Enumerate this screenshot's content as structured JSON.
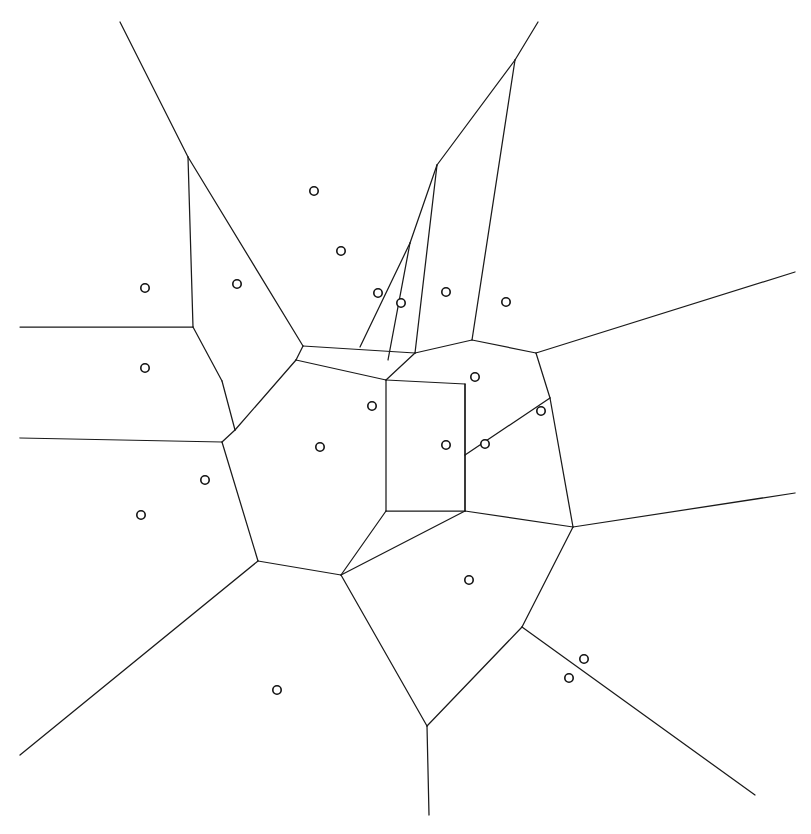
{
  "figure": {
    "width": 811,
    "height": 834,
    "background_color": "#ffffff",
    "edge_color": "#1a1a1a",
    "site_stroke_color": "#111111",
    "site_fill_color": "#ffffff",
    "edge_stroke_width": 1.25,
    "site_radius": 4.2,
    "site_count": 21,
    "edge_count": 44
  },
  "chart_data": {
    "type": "scatter",
    "subtitle": "",
    "xlabel": "",
    "ylabel": "",
    "xlim": [
      0,
      811
    ],
    "ylim": [
      0,
      834
    ],
    "grid": false,
    "legend": "none",
    "annotations": [],
    "marker_style": "open-circle",
    "sites": [
      {
        "id": "s1",
        "x": 314,
        "y": 191
      },
      {
        "id": "s2",
        "x": 341,
        "y": 251
      },
      {
        "id": "s3",
        "x": 145,
        "y": 288
      },
      {
        "id": "s4",
        "x": 237,
        "y": 284
      },
      {
        "id": "s5",
        "x": 378,
        "y": 293
      },
      {
        "id": "s6",
        "x": 401,
        "y": 303
      },
      {
        "id": "s7",
        "x": 446,
        "y": 292
      },
      {
        "id": "s8",
        "x": 506,
        "y": 302
      },
      {
        "id": "s9",
        "x": 145,
        "y": 368
      },
      {
        "id": "s10",
        "x": 475,
        "y": 377
      },
      {
        "id": "s11",
        "x": 372,
        "y": 406
      },
      {
        "id": "s12",
        "x": 541,
        "y": 411
      },
      {
        "id": "s13",
        "x": 320,
        "y": 447
      },
      {
        "id": "s14",
        "x": 446,
        "y": 445
      },
      {
        "id": "s15",
        "x": 485,
        "y": 444
      },
      {
        "id": "s16",
        "x": 141,
        "y": 515
      },
      {
        "id": "s17",
        "x": 469,
        "y": 580
      },
      {
        "id": "s18",
        "x": 584,
        "y": 659
      },
      {
        "id": "s19",
        "x": 569,
        "y": 678
      },
      {
        "id": "s20",
        "x": 277,
        "y": 690
      },
      {
        "id": "s21",
        "x": 205,
        "y": 480
      }
    ],
    "edges": [
      {
        "id": "e1",
        "points": [
          [
            120,
            22
          ],
          [
            188,
            157
          ]
        ],
        "kind": "ray"
      },
      {
        "id": "e2",
        "points": [
          [
            188,
            157
          ],
          [
            193,
            327
          ]
        ],
        "kind": "segment"
      },
      {
        "id": "e3",
        "points": [
          [
            188,
            157
          ],
          [
            303,
            346
          ]
        ],
        "kind": "segment"
      },
      {
        "id": "e4",
        "points": [
          [
            20,
            327
          ],
          [
            193,
            327
          ]
        ],
        "kind": "ray"
      },
      {
        "id": "e5",
        "points": [
          [
            193,
            327
          ],
          [
            222,
            381
          ]
        ],
        "kind": "segment"
      },
      {
        "id": "e6",
        "points": [
          [
            222,
            381
          ],
          [
            235,
            430
          ]
        ],
        "kind": "segment"
      },
      {
        "id": "e7",
        "points": [
          [
            20,
            438
          ],
          [
            222,
            442
          ]
        ],
        "kind": "ray"
      },
      {
        "id": "e8",
        "points": [
          [
            235,
            430
          ],
          [
            222,
            442
          ]
        ],
        "kind": "segment"
      },
      {
        "id": "e9",
        "points": [
          [
            222,
            442
          ],
          [
            258,
            561
          ]
        ],
        "kind": "segment"
      },
      {
        "id": "e10",
        "points": [
          [
            258,
            561
          ],
          [
            20,
            755
          ]
        ],
        "kind": "ray"
      },
      {
        "id": "e11",
        "points": [
          [
            258,
            561
          ],
          [
            341,
            575
          ]
        ],
        "kind": "segment"
      },
      {
        "id": "e12",
        "points": [
          [
            341,
            575
          ],
          [
            427,
            726
          ]
        ],
        "kind": "segment"
      },
      {
        "id": "e13",
        "points": [
          [
            427,
            726
          ],
          [
            429,
            815
          ]
        ],
        "kind": "ray"
      },
      {
        "id": "e14",
        "points": [
          [
            427,
            726
          ],
          [
            522,
            627
          ]
        ],
        "kind": "segment"
      },
      {
        "id": "e15",
        "points": [
          [
            522,
            627
          ],
          [
            573,
            527
          ]
        ],
        "kind": "segment"
      },
      {
        "id": "e16",
        "points": [
          [
            522,
            627
          ],
          [
            755,
            795
          ]
        ],
        "kind": "ray"
      },
      {
        "id": "e17",
        "points": [
          [
            573,
            527
          ],
          [
            795,
            493
          ]
        ],
        "kind": "ray"
      },
      {
        "id": "e18",
        "points": [
          [
            573,
            527
          ],
          [
            465,
            511
          ]
        ],
        "kind": "segment"
      },
      {
        "id": "e19",
        "points": [
          [
            465,
            511
          ],
          [
            341,
            575
          ]
        ],
        "kind": "segment"
      },
      {
        "id": "e20",
        "points": [
          [
            465,
            511
          ],
          [
            465,
            384
          ]
        ],
        "kind": "segment"
      },
      {
        "id": "e21",
        "points": [
          [
            465,
            384
          ],
          [
            386,
            380
          ]
        ],
        "kind": "segment"
      },
      {
        "id": "e22",
        "points": [
          [
            386,
            380
          ],
          [
            386,
            511
          ]
        ],
        "kind": "segment"
      },
      {
        "id": "e23",
        "points": [
          [
            386,
            511
          ],
          [
            465,
            511
          ]
        ],
        "kind": "segment"
      },
      {
        "id": "e24",
        "points": [
          [
            386,
            511
          ],
          [
            341,
            575
          ]
        ],
        "kind": "segment"
      },
      {
        "id": "e25",
        "points": [
          [
            386,
            380
          ],
          [
            415,
            353
          ]
        ],
        "kind": "segment"
      },
      {
        "id": "e26",
        "points": [
          [
            415,
            353
          ],
          [
            303,
            346
          ]
        ],
        "kind": "segment"
      },
      {
        "id": "e27",
        "points": [
          [
            303,
            346
          ],
          [
            296,
            360
          ]
        ],
        "kind": "segment"
      },
      {
        "id": "e28",
        "points": [
          [
            296,
            360
          ],
          [
            235,
            430
          ]
        ],
        "kind": "segment"
      },
      {
        "id": "e29",
        "points": [
          [
            296,
            360
          ],
          [
            386,
            380
          ]
        ],
        "kind": "segment"
      },
      {
        "id": "e30",
        "points": [
          [
            415,
            353
          ],
          [
            437,
            165
          ]
        ],
        "kind": "segment"
      },
      {
        "id": "e31",
        "points": [
          [
            437,
            165
          ],
          [
            515,
            60
          ]
        ],
        "kind": "segment"
      },
      {
        "id": "e32",
        "points": [
          [
            515,
            60
          ],
          [
            538,
            22
          ]
        ],
        "kind": "ray"
      },
      {
        "id": "e33",
        "points": [
          [
            515,
            60
          ],
          [
            472,
            340
          ]
        ],
        "kind": "segment"
      },
      {
        "id": "e34",
        "points": [
          [
            472,
            340
          ],
          [
            415,
            353
          ]
        ],
        "kind": "segment"
      },
      {
        "id": "e35",
        "points": [
          [
            472,
            340
          ],
          [
            536,
            353
          ]
        ],
        "kind": "segment"
      },
      {
        "id": "e36",
        "points": [
          [
            536,
            353
          ],
          [
            795,
            272
          ]
        ],
        "kind": "ray"
      },
      {
        "id": "e37",
        "points": [
          [
            536,
            353
          ],
          [
            550,
            398
          ]
        ],
        "kind": "segment"
      },
      {
        "id": "e38",
        "points": [
          [
            550,
            398
          ],
          [
            465,
            455
          ]
        ],
        "kind": "segment"
      },
      {
        "id": "e39",
        "points": [
          [
            550,
            398
          ],
          [
            573,
            527
          ]
        ],
        "kind": "segment"
      },
      {
        "id": "e40",
        "points": [
          [
            465,
            455
          ],
          [
            465,
            511
          ]
        ],
        "kind": "segment"
      },
      {
        "id": "e41",
        "points": [
          [
            465,
            455
          ],
          [
            465,
            384
          ]
        ],
        "kind": "segment"
      },
      {
        "id": "e42",
        "points": [
          [
            437,
            165
          ],
          [
            410,
            243
          ]
        ],
        "kind": "segment"
      },
      {
        "id": "e43",
        "points": [
          [
            410,
            243
          ],
          [
            360,
            347
          ]
        ],
        "kind": "segment"
      },
      {
        "id": "e44",
        "points": [
          [
            410,
            243
          ],
          [
            388,
            360
          ]
        ],
        "kind": "segment"
      }
    ]
  }
}
